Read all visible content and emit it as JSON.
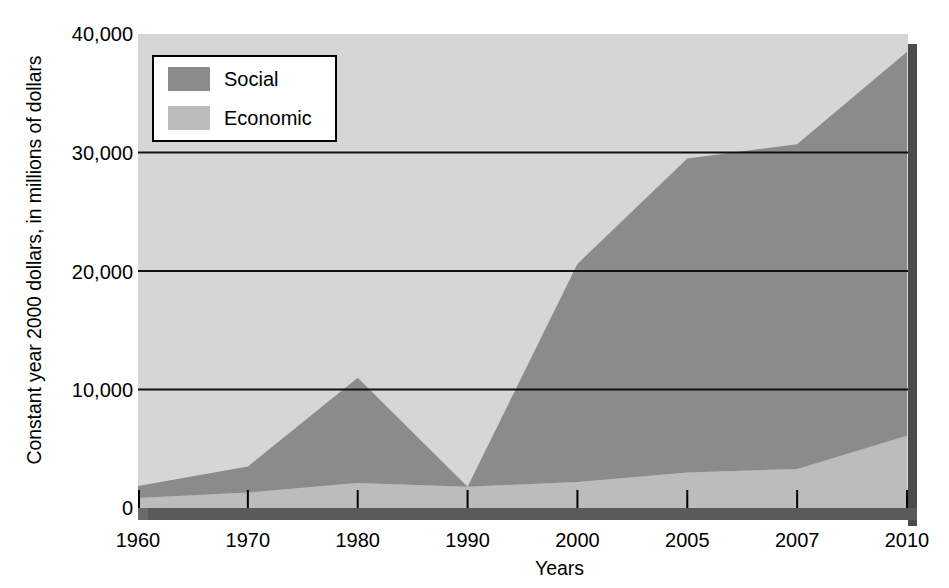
{
  "chart_data": {
    "type": "area",
    "stacked": true,
    "title": "",
    "subtitle": "",
    "xlabel": "Years",
    "ylabel": "Constant year 2000 dollars, in millions of dollars",
    "categories": [
      "1960",
      "1970",
      "1980",
      "1990",
      "2000",
      "2005",
      "2007",
      "2010"
    ],
    "x_tick_labels": [
      "1960",
      "1970",
      "1980",
      "1990",
      "2000",
      "2005",
      "2007",
      "2010"
    ],
    "y_tick_labels": [
      "0",
      "10,000",
      "20,000",
      "30,000",
      "40,000"
    ],
    "y_tick_values": [
      0,
      10000,
      20000,
      30000,
      40000
    ],
    "ylim": [
      0,
      40000
    ],
    "grid": "horizontal",
    "legend_position": "top-left",
    "series": [
      {
        "name": "Social",
        "color": "#8b8b8b",
        "values": [
          1000,
          2200,
          8900,
          0,
          18400,
          26500,
          27400,
          32400
        ]
      },
      {
        "name": "Economic",
        "color": "#bcbcbc",
        "values": [
          850,
          1300,
          2100,
          1800,
          2200,
          3000,
          3300,
          6100
        ]
      }
    ],
    "totals": [
      1850,
      3500,
      11000,
      1800,
      20600,
      29500,
      30700,
      38500
    ],
    "annotations": []
  },
  "legend": {
    "items": [
      {
        "label": "Social",
        "color": "#8b8b8b"
      },
      {
        "label": "Economic",
        "color": "#bcbcbc"
      }
    ]
  },
  "axes": {
    "x_title": "Years",
    "y_title": "Constant year 2000 dollars, in millions of dollars"
  },
  "colors": {
    "plot_background": "#d6d6d6",
    "social": "#8b8b8b",
    "economic": "#bcbcbc",
    "gridline": "#111111",
    "shadow": "#4b4b4b",
    "page_background": "#ffffff",
    "text": "#000000"
  }
}
